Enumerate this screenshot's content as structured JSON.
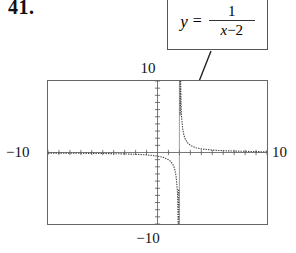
{
  "problem": {
    "number": "41."
  },
  "equation_callout": {
    "lhs": "y",
    "equals": "=",
    "numerator": "1",
    "denominator_var": "x",
    "denominator_op": "−",
    "denominator_const": "2",
    "full_text": "y = 1/(x - 2)"
  },
  "graph": {
    "label_top": "10",
    "label_bottom": "−10",
    "label_left": "−10",
    "label_right": "10",
    "frame_color": "#666666",
    "curve_color": "#444444"
  },
  "chart_data": {
    "type": "line",
    "function": "y = 1/(x - 2)",
    "xlabel": "",
    "ylabel": "",
    "xlim": [
      -10,
      10
    ],
    "ylim": [
      -10,
      10
    ],
    "xtick_step": 1,
    "ytick_step": 1,
    "grid": false,
    "legend": "none",
    "asymptotes": {
      "vertical": [
        2
      ],
      "horizontal": [
        0
      ]
    },
    "annotations": [
      {
        "text": "y = 1/(x - 2)",
        "points_to_x": 2.2,
        "points_to_y": 7.0
      }
    ],
    "series": [
      {
        "name": "left branch (x < 2)",
        "x": [
          -10,
          -9,
          -8,
          -7,
          -6,
          -5,
          -4,
          -3,
          -2,
          -1,
          0,
          0.5,
          1,
          1.2,
          1.4,
          1.5,
          1.6,
          1.7,
          1.8,
          1.85,
          1.9,
          1.93,
          1.95,
          1.97,
          1.98,
          1.99
        ],
        "y": [
          -0.083,
          -0.091,
          -0.1,
          -0.111,
          -0.125,
          -0.143,
          -0.167,
          -0.2,
          -0.25,
          -0.333,
          -0.5,
          -0.667,
          -1,
          -1.25,
          -1.667,
          -2,
          -2.5,
          -3.333,
          -5,
          -6.667,
          -10,
          -14.3,
          -20,
          -33.3,
          -50,
          -100
        ]
      },
      {
        "name": "right branch (x > 2)",
        "x": [
          2.01,
          2.02,
          2.03,
          2.05,
          2.07,
          2.1,
          2.15,
          2.2,
          2.3,
          2.4,
          2.5,
          2.7,
          3,
          3.5,
          4,
          5,
          6,
          7,
          8,
          9,
          10
        ],
        "y": [
          100,
          50,
          33.3,
          20,
          14.3,
          10,
          6.667,
          5,
          3.333,
          2.5,
          2,
          1.429,
          1,
          0.667,
          0.5,
          0.333,
          0.25,
          0.2,
          0.167,
          0.125,
          0.1
        ]
      }
    ]
  }
}
